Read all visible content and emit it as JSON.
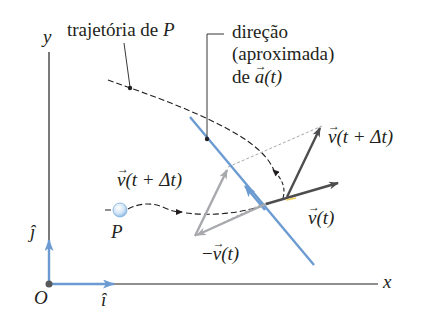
{
  "diagram": {
    "axes": {
      "x_label": "x",
      "y_label": "y",
      "origin_label": "O",
      "unit_i_label": "î",
      "unit_j_label": "ĵ"
    },
    "particle": {
      "label": "P"
    },
    "annotations": {
      "trajectory": "trajetória de P",
      "trajectory_prefix": "trajetória de ",
      "trajectory_var": "P",
      "accel_line1": "direção",
      "accel_line2": "(aproximada)",
      "accel_line3_prefix": "de ",
      "accel_var": "a",
      "accel_arg": "(t)"
    },
    "vectors": {
      "v_t": {
        "sym": "v",
        "arg": "(t)",
        "color": "#4d4d4f"
      },
      "v_t_dt": {
        "sym": "v",
        "arg": "(t + Δt)",
        "color": "#4d4d4f"
      },
      "v_t_dt_copy": {
        "sym": "v",
        "arg": "(t + Δt)",
        "color": "#a7a9ac"
      },
      "neg_v_t": {
        "prefix": "−",
        "sym": "v",
        "arg": "(t)",
        "color": "#a7a9ac"
      }
    },
    "colors": {
      "accel_line": "#6c9bd2",
      "unit_vectors": "#6c9bd2",
      "axes": "#231f20",
      "trajectory": "#231f20"
    }
  }
}
